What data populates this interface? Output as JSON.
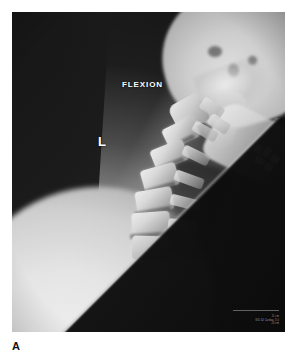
{
  "figure": {
    "panel_label": "A",
    "modality": "radiograph",
    "view": "lateral cervical spine"
  },
  "radiograph": {
    "annotations": {
      "position_marker": "FLEXION",
      "side_marker": "L"
    },
    "technical_stamp": {
      "line1": "11 cm",
      "line2": "SID 44 Cardiac 3.0",
      "line3": "23 cm"
    },
    "colors": {
      "film_background": "#111111",
      "bone_bright": "#f0f0f0",
      "soft_tissue": "#d2d2d2",
      "collimated_field": "#0b0b0b",
      "annotation_text": "#ffffff"
    }
  },
  "anatomy": [
    {
      "name": "skull-base",
      "label": "skull base / occiput"
    },
    {
      "name": "mandible",
      "label": "mandible"
    },
    {
      "name": "dental-restorations",
      "label": "dental restorations"
    },
    {
      "name": "cervical-vertebrae",
      "label": "cervical vertebral bodies"
    },
    {
      "name": "spinous-processes",
      "label": "spinous processes"
    },
    {
      "name": "airway",
      "label": "airway / trachea"
    },
    {
      "name": "shoulder-soft-tissue",
      "label": "shoulder soft tissue"
    }
  ]
}
